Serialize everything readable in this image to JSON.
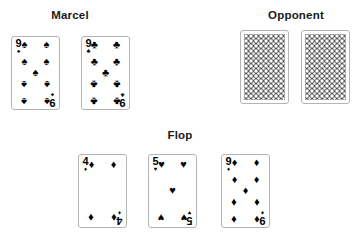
{
  "background_color": "#ffffff",
  "ink_color": "#000000",
  "card_border_color": "#b4b4b4",
  "sections": {
    "player": {
      "heading": "Marcel"
    },
    "opponent": {
      "heading": "Opponent"
    },
    "board": {
      "heading": "Flop"
    }
  },
  "suit_glyphs": {
    "spade": "♠",
    "heart": "♥",
    "club": "♣",
    "diamond": "♦"
  },
  "player_cards": [
    {
      "rank": "9",
      "suit": "spade",
      "suit_glyph": "♠",
      "index_top": "9",
      "index_bottom": "6"
    },
    {
      "rank": "9",
      "suit": "club",
      "suit_glyph": "♣",
      "index_top": "9",
      "index_bottom": "6"
    }
  ],
  "opponent_cards": [
    {
      "face": "down",
      "back_pattern": "circle-lattice"
    },
    {
      "face": "down",
      "back_pattern": "circle-lattice"
    }
  ],
  "board_cards": [
    {
      "rank": "4",
      "suit": "diamond",
      "suit_glyph": "♦",
      "index_top": "4",
      "index_bottom": "4"
    },
    {
      "rank": "5",
      "suit": "heart",
      "suit_glyph": "♥",
      "index_top": "5",
      "index_bottom": "5"
    },
    {
      "rank": "9",
      "suit": "diamond",
      "suit_glyph": "♦",
      "index_top": "9",
      "index_bottom": "6"
    }
  ]
}
